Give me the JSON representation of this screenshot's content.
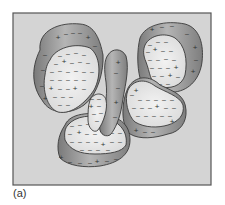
{
  "figure": {
    "caption": "(a)",
    "colors": {
      "background": "#d4d4d4",
      "frame": "#555555",
      "rim": "#8a8a8a",
      "rim_highlight": "#b8b8b8",
      "face": "#e6e6e6",
      "outline": "#3a3a3a",
      "charge": "#333333"
    },
    "symbols": {
      "negative": "–",
      "positive": "+"
    },
    "particles": [
      {
        "id": "top-left",
        "rim": "M40,50 C38,30 60,22 80,24 C95,25 100,40 103,55 C104,70 98,95 84,105 C70,115 50,115 42,100 C33,88 30,70 40,50 Z",
        "face": "M50,60 C55,48 75,42 90,48 C100,55 102,75 94,90 C86,102 72,115 58,112 C47,108 42,90 45,75 C46,68 47,64 50,60 Z",
        "charges": [
          {
            "x": 58,
            "y": 38,
            "s": "+"
          },
          {
            "x": 66,
            "y": 34,
            "s": "–"
          },
          {
            "x": 73,
            "y": 33,
            "s": "–"
          },
          {
            "x": 80,
            "y": 33,
            "s": "–"
          },
          {
            "x": 88,
            "y": 38,
            "s": "+"
          },
          {
            "x": 95,
            "y": 46,
            "s": "–"
          },
          {
            "x": 45,
            "y": 55,
            "s": "–"
          },
          {
            "x": 43,
            "y": 70,
            "s": "–"
          },
          {
            "x": 42,
            "y": 86,
            "s": "–"
          },
          {
            "x": 45,
            "y": 99,
            "s": "+"
          },
          {
            "x": 60,
            "y": 56,
            "s": "–"
          },
          {
            "x": 68,
            "y": 54,
            "s": "–"
          },
          {
            "x": 76,
            "y": 53,
            "s": "–"
          },
          {
            "x": 84,
            "y": 55,
            "s": "–"
          },
          {
            "x": 56,
            "y": 64,
            "s": "–"
          },
          {
            "x": 64,
            "y": 62,
            "s": "+"
          },
          {
            "x": 72,
            "y": 63,
            "s": "–"
          },
          {
            "x": 80,
            "y": 62,
            "s": "–"
          },
          {
            "x": 88,
            "y": 63,
            "s": "–"
          },
          {
            "x": 52,
            "y": 72,
            "s": "–"
          },
          {
            "x": 60,
            "y": 71,
            "s": "–"
          },
          {
            "x": 68,
            "y": 72,
            "s": "–"
          },
          {
            "x": 76,
            "y": 71,
            "s": "–"
          },
          {
            "x": 84,
            "y": 72,
            "s": "–"
          },
          {
            "x": 92,
            "y": 72,
            "s": "–"
          },
          {
            "x": 52,
            "y": 80,
            "s": "–"
          },
          {
            "x": 60,
            "y": 80,
            "s": "–"
          },
          {
            "x": 68,
            "y": 80,
            "s": "–"
          },
          {
            "x": 76,
            "y": 80,
            "s": "–"
          },
          {
            "x": 84,
            "y": 80,
            "s": "–"
          },
          {
            "x": 51,
            "y": 89,
            "s": "+"
          },
          {
            "x": 60,
            "y": 89,
            "s": "–"
          },
          {
            "x": 68,
            "y": 89,
            "s": "–"
          },
          {
            "x": 75,
            "y": 89,
            "s": "+"
          },
          {
            "x": 84,
            "y": 89,
            "s": "–"
          },
          {
            "x": 55,
            "y": 97,
            "s": "–"
          },
          {
            "x": 63,
            "y": 97,
            "s": "–"
          },
          {
            "x": 71,
            "y": 97,
            "s": "–"
          },
          {
            "x": 60,
            "y": 105,
            "s": "–"
          },
          {
            "x": 68,
            "y": 105,
            "s": "–"
          }
        ]
      },
      {
        "id": "top-right",
        "rim": "M140,38 C145,25 165,20 185,24 C200,28 204,45 202,62 C200,78 190,90 175,92 C160,93 145,88 140,78 C137,66 137,50 140,38 Z",
        "face": "M145,45 C150,35 165,32 175,38 C185,45 188,60 185,75 C182,86 170,90 158,86 C150,83 150,72 146,62 C143,55 143,50 145,45 Z",
        "charges": [
          {
            "x": 152,
            "y": 30,
            "s": "+"
          },
          {
            "x": 162,
            "y": 27,
            "s": "–"
          },
          {
            "x": 172,
            "y": 26,
            "s": "–"
          },
          {
            "x": 187,
            "y": 34,
            "s": "–"
          },
          {
            "x": 195,
            "y": 48,
            "s": "+"
          },
          {
            "x": 196,
            "y": 60,
            "s": "–"
          },
          {
            "x": 193,
            "y": 72,
            "s": "+"
          },
          {
            "x": 150,
            "y": 45,
            "s": "–"
          },
          {
            "x": 158,
            "y": 42,
            "s": "–"
          },
          {
            "x": 166,
            "y": 42,
            "s": "–"
          },
          {
            "x": 148,
            "y": 52,
            "s": "–"
          },
          {
            "x": 155,
            "y": 50,
            "s": "+"
          },
          {
            "x": 163,
            "y": 51,
            "s": "–"
          },
          {
            "x": 171,
            "y": 51,
            "s": "–"
          },
          {
            "x": 150,
            "y": 60,
            "s": "–"
          },
          {
            "x": 158,
            "y": 60,
            "s": "–"
          },
          {
            "x": 166,
            "y": 59,
            "s": "–"
          },
          {
            "x": 174,
            "y": 60,
            "s": "–"
          },
          {
            "x": 152,
            "y": 68,
            "s": "–"
          },
          {
            "x": 160,
            "y": 68,
            "s": "–"
          },
          {
            "x": 168,
            "y": 68,
            "s": "–"
          },
          {
            "x": 176,
            "y": 68,
            "s": "+"
          },
          {
            "x": 154,
            "y": 76,
            "s": "–"
          },
          {
            "x": 162,
            "y": 76,
            "s": "–"
          },
          {
            "x": 170,
            "y": 76,
            "s": "+"
          },
          {
            "x": 178,
            "y": 77,
            "s": "–"
          },
          {
            "x": 160,
            "y": 84,
            "s": "–"
          },
          {
            "x": 168,
            "y": 84,
            "s": "–"
          }
        ]
      },
      {
        "id": "middle-right",
        "rim": "M128,88 C135,75 150,75 160,85 C175,92 185,95 186,110 C187,122 180,132 168,134 C155,138 140,140 130,134 C122,128 120,105 128,88 Z",
        "face": "M128,90 C133,80 145,78 155,86 C165,92 180,96 183,105 C185,115 178,122 168,125 C158,128 145,128 135,122 C128,116 124,100 128,90 Z",
        "charges": [
          {
            "x": 132,
            "y": 95,
            "s": "–"
          },
          {
            "x": 136,
            "y": 91,
            "s": "+"
          },
          {
            "x": 140,
            "y": 100,
            "s": "–"
          },
          {
            "x": 148,
            "y": 100,
            "s": "–"
          },
          {
            "x": 156,
            "y": 100,
            "s": "–"
          },
          {
            "x": 164,
            "y": 100,
            "s": "–"
          },
          {
            "x": 172,
            "y": 100,
            "s": "–"
          },
          {
            "x": 134,
            "y": 108,
            "s": "–"
          },
          {
            "x": 142,
            "y": 108,
            "s": "–"
          },
          {
            "x": 150,
            "y": 108,
            "s": "–"
          },
          {
            "x": 157,
            "y": 107,
            "s": "+"
          },
          {
            "x": 166,
            "y": 108,
            "s": "–"
          },
          {
            "x": 174,
            "y": 108,
            "s": "–"
          },
          {
            "x": 138,
            "y": 116,
            "s": "–"
          },
          {
            "x": 146,
            "y": 116,
            "s": "–"
          },
          {
            "x": 154,
            "y": 116,
            "s": "–"
          },
          {
            "x": 162,
            "y": 116,
            "s": "–"
          },
          {
            "x": 170,
            "y": 116,
            "s": "–"
          },
          {
            "x": 136,
            "y": 131,
            "s": "+"
          },
          {
            "x": 145,
            "y": 132,
            "s": "–"
          },
          {
            "x": 153,
            "y": 132,
            "s": "–"
          },
          {
            "x": 172,
            "y": 122,
            "s": "+"
          }
        ]
      },
      {
        "id": "bottom-center",
        "rim": "M65,125 C70,113 90,112 105,115 C120,117 130,125 130,140 C130,155 118,163 100,166 C85,168 68,166 60,158 C56,148 58,135 65,125 Z",
        "face": "M68,125 C75,116 92,114 106,118 C120,122 128,132 126,145 C122,152 110,154 95,154 C80,154 70,150 65,140 C64,133 65,128 68,125 Z",
        "charges": [
          {
            "x": 72,
            "y": 126,
            "s": "–"
          },
          {
            "x": 80,
            "y": 125,
            "s": "–"
          },
          {
            "x": 88,
            "y": 124,
            "s": "–"
          },
          {
            "x": 70,
            "y": 134,
            "s": "–"
          },
          {
            "x": 79,
            "y": 133,
            "s": "+"
          },
          {
            "x": 87,
            "y": 134,
            "s": "–"
          },
          {
            "x": 95,
            "y": 134,
            "s": "–"
          },
          {
            "x": 112,
            "y": 133,
            "s": "–"
          },
          {
            "x": 120,
            "y": 133,
            "s": "–"
          },
          {
            "x": 72,
            "y": 142,
            "s": "–"
          },
          {
            "x": 80,
            "y": 142,
            "s": "–"
          },
          {
            "x": 88,
            "y": 142,
            "s": "–"
          },
          {
            "x": 96,
            "y": 142,
            "s": "–"
          },
          {
            "x": 103,
            "y": 145,
            "s": "+"
          },
          {
            "x": 112,
            "y": 142,
            "s": "–"
          },
          {
            "x": 120,
            "y": 142,
            "s": "–"
          },
          {
            "x": 82,
            "y": 150,
            "s": "–"
          },
          {
            "x": 90,
            "y": 150,
            "s": "–"
          },
          {
            "x": 98,
            "y": 150,
            "s": "–"
          },
          {
            "x": 108,
            "y": 150,
            "s": "–"
          },
          {
            "x": 61,
            "y": 158,
            "s": "+"
          },
          {
            "x": 70,
            "y": 162,
            "s": "–"
          },
          {
            "x": 80,
            "y": 163,
            "s": "–"
          },
          {
            "x": 90,
            "y": 163,
            "s": "–"
          },
          {
            "x": 97,
            "y": 162,
            "s": "+"
          },
          {
            "x": 107,
            "y": 161,
            "s": "–"
          },
          {
            "x": 116,
            "y": 159,
            "s": "–"
          }
        ]
      },
      {
        "id": "center-band",
        "rim": "M108,55 C112,48 122,48 126,56 C130,70 124,90 122,105 C120,118 115,130 110,135 C104,138 98,132 100,125 C104,112 108,98 106,82 C104,70 104,60 108,55 Z",
        "face": "M90,100 C94,92 104,92 106,100 C108,108 104,122 98,130 C94,134 88,128 88,120 C88,112 88,106 90,100 Z",
        "charges": [
          {
            "x": 118,
            "y": 63,
            "s": "+"
          },
          {
            "x": 116,
            "y": 73,
            "s": "–"
          },
          {
            "x": 118,
            "y": 88,
            "s": "–"
          },
          {
            "x": 116,
            "y": 103,
            "s": "+"
          },
          {
            "x": 115,
            "y": 117,
            "s": "–"
          },
          {
            "x": 92,
            "y": 99,
            "s": "–"
          },
          {
            "x": 99,
            "y": 99,
            "s": "–"
          },
          {
            "x": 91,
            "y": 107,
            "s": "+"
          },
          {
            "x": 99,
            "y": 106,
            "s": "–"
          },
          {
            "x": 94,
            "y": 114,
            "s": "–"
          },
          {
            "x": 101,
            "y": 113,
            "s": "–"
          },
          {
            "x": 97,
            "y": 121,
            "s": "–"
          }
        ]
      }
    ]
  }
}
